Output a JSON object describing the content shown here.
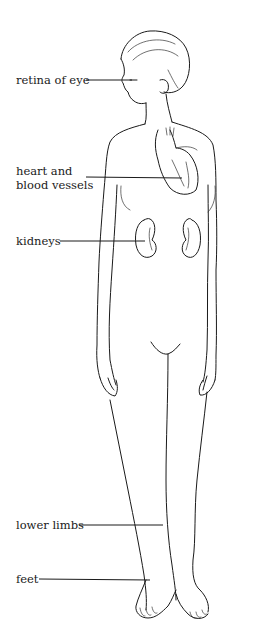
{
  "figure": {
    "labels": [
      {
        "id": "retina",
        "text": "retina of eye"
      },
      {
        "id": "heart",
        "lines": [
          "heart and",
          "blood vessels"
        ]
      },
      {
        "id": "kidneys",
        "text": "kidneys"
      },
      {
        "id": "lower-limbs",
        "text": "lower limbs"
      },
      {
        "id": "feet",
        "text": "feet"
      }
    ]
  }
}
